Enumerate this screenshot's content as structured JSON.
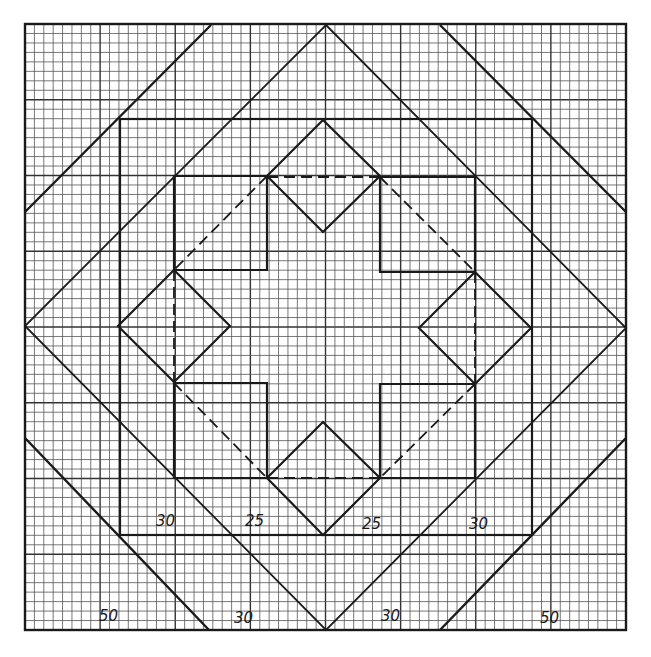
{
  "diagram": {
    "type": "quilt-block-drafting-grid",
    "grid": {
      "cells": 64,
      "major_every": 8,
      "x0": 25,
      "y0": 24,
      "x1": 626,
      "y1": 630
    },
    "colors": {
      "ink": "#1a1a1a",
      "grid_minor": "#555555",
      "grid_major": "#333333",
      "paper": "#ffffff"
    },
    "upper_labels": [
      {
        "text": "30",
        "x": 170,
        "y": 526
      },
      {
        "text": "25",
        "x": 259,
        "y": 526
      },
      {
        "text": "25",
        "x": 374,
        "y": 529
      },
      {
        "text": "30",
        "x": 481,
        "y": 529
      }
    ],
    "lower_labels": [
      {
        "text": "50",
        "x": 113,
        "y": 621
      },
      {
        "text": "30",
        "x": 247,
        "y": 623
      },
      {
        "text": "30",
        "x": 393,
        "y": 621
      },
      {
        "text": "50",
        "x": 552,
        "y": 623
      }
    ]
  }
}
